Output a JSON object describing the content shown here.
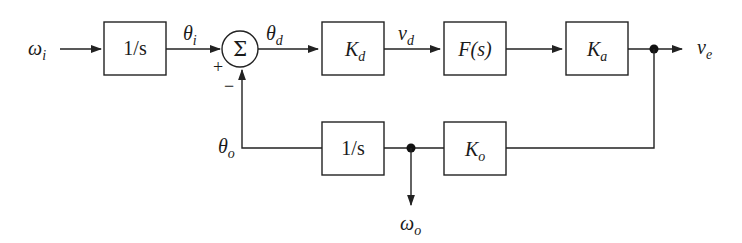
{
  "diagram": {
    "type": "control-system-block-diagram",
    "signals": {
      "omega_i": {
        "base": "ω",
        "sub": "i"
      },
      "theta_i": {
        "base": "θ",
        "sub": "i"
      },
      "theta_d": {
        "base": "θ",
        "sub": "d"
      },
      "v_d": {
        "base": "v",
        "sub": "d"
      },
      "v_e": {
        "base": "v",
        "sub": "e"
      },
      "theta_o": {
        "base": "θ",
        "sub": "o"
      },
      "omega_o": {
        "base": "ω",
        "sub": "o"
      }
    },
    "blocks": {
      "integrator_in": {
        "label": "1/s"
      },
      "kd": {
        "base": "K",
        "sub": "d"
      },
      "fs": {
        "label": "F(s)"
      },
      "ka": {
        "base": "K",
        "sub": "a"
      },
      "integrator_fb": {
        "label": "1/s"
      },
      "ko": {
        "base": "K",
        "sub": "o"
      }
    },
    "summing_junction": {
      "symbol": "Σ",
      "plus": "+",
      "minus": "−"
    },
    "edges": [
      [
        "omega_i",
        "integrator_in"
      ],
      [
        "integrator_in",
        "summing_junction",
        "theta_i"
      ],
      [
        "summing_junction",
        "kd",
        "theta_d"
      ],
      [
        "kd",
        "fs",
        "v_d"
      ],
      [
        "fs",
        "ka"
      ],
      [
        "ka",
        "v_e"
      ],
      [
        "v_e",
        "ko"
      ],
      [
        "ko",
        "integrator_fb"
      ],
      [
        "ko",
        "omega_o"
      ],
      [
        "integrator_fb",
        "summing_junction",
        "theta_o"
      ]
    ]
  }
}
